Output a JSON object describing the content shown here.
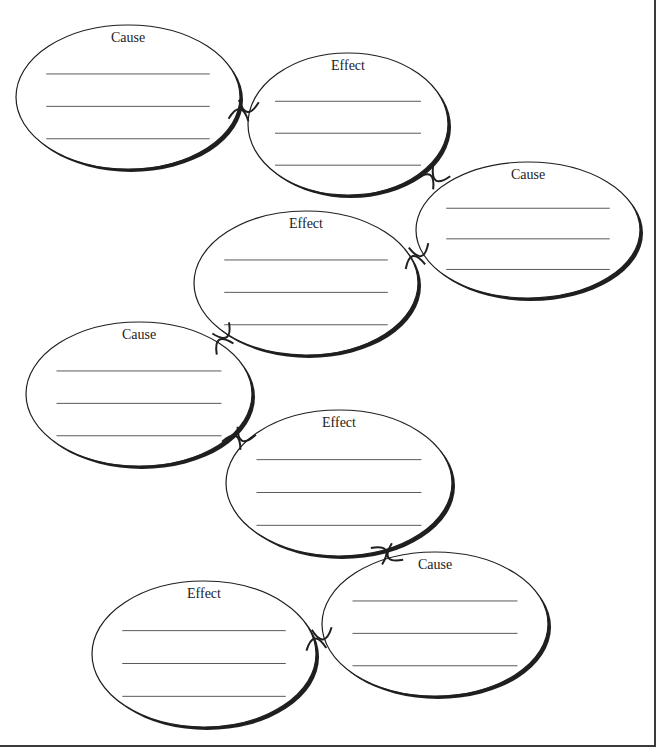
{
  "diagram": {
    "type": "cause-effect chain organizer",
    "colors": {
      "stroke": "#1f1f1f",
      "line": "#5a5a5a",
      "background": "#ffffff"
    },
    "nodes": [
      {
        "label": "Cause",
        "cx": 128,
        "cy": 97,
        "rx": 112,
        "ry": 72
      },
      {
        "label": "Effect",
        "cx": 348,
        "cy": 124,
        "rx": 100,
        "ry": 71
      },
      {
        "label": "Cause",
        "cx": 528,
        "cy": 230,
        "rx": 112,
        "ry": 68
      },
      {
        "label": "Effect",
        "cx": 306,
        "cy": 283,
        "rx": 112,
        "ry": 72
      },
      {
        "label": "Cause",
        "cx": 139,
        "cy": 394,
        "rx": 113,
        "ry": 72
      },
      {
        "label": "Effect",
        "cx": 339,
        "cy": 483,
        "rx": 113,
        "ry": 73
      },
      {
        "label": "Cause",
        "cx": 435,
        "cy": 624,
        "rx": 113,
        "ry": 72
      },
      {
        "label": "Effect",
        "cx": 204,
        "cy": 654,
        "rx": 112,
        "ry": 73
      }
    ],
    "lines_per_node": 3
  }
}
